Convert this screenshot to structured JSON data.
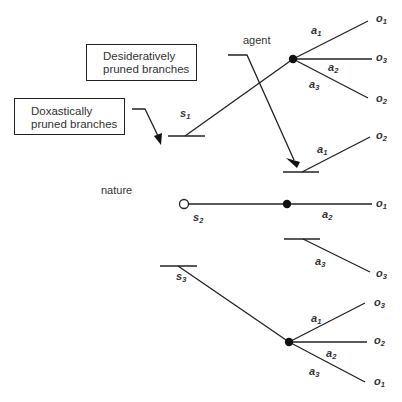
{
  "diagram": {
    "boxes": {
      "desideratively": {
        "line1": "Desideratively",
        "line2": "pruned branches"
      },
      "doxastically": {
        "line1": "Doxastically",
        "line2": "pruned branches"
      }
    },
    "nodes": {
      "agent_label": "agent",
      "nature_label": "nature"
    },
    "states": {
      "s1": {
        "base": "s",
        "sub": "1"
      },
      "s2": {
        "base": "s",
        "sub": "2"
      },
      "s3": {
        "base": "s",
        "sub": "3"
      }
    },
    "actions": {
      "top_a1": {
        "base": "a",
        "sub": "1"
      },
      "top_a2": {
        "base": "a",
        "sub": "2"
      },
      "top_a3": {
        "base": "a",
        "sub": "3"
      },
      "mid_a1": {
        "base": "a",
        "sub": "1"
      },
      "mid_a2": {
        "base": "a",
        "sub": "2"
      },
      "mid_a3": {
        "base": "a",
        "sub": "3"
      },
      "bot_a1": {
        "base": "a",
        "sub": "1"
      },
      "bot_a2": {
        "base": "a",
        "sub": "2"
      },
      "bot_a3": {
        "base": "a",
        "sub": "3"
      }
    },
    "outcomes": {
      "top_o1": {
        "base": "o",
        "sub": "1"
      },
      "top_o3": {
        "base": "o",
        "sub": "3"
      },
      "top_o2": {
        "base": "o",
        "sub": "2"
      },
      "mid_o2": {
        "base": "o",
        "sub": "2"
      },
      "mid_o1": {
        "base": "o",
        "sub": "1"
      },
      "mid_o3": {
        "base": "o",
        "sub": "3"
      },
      "bot_o3": {
        "base": "o",
        "sub": "3"
      },
      "bot_o2": {
        "base": "o",
        "sub": "2"
      },
      "bot_o1": {
        "base": "o",
        "sub": "1"
      }
    }
  }
}
